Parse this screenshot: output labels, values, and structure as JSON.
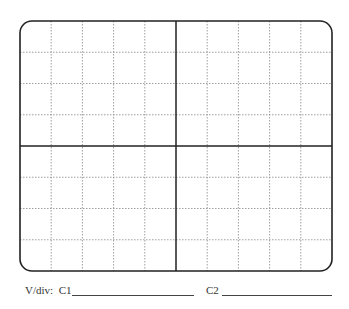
{
  "graticule": {
    "divisions_x": 10,
    "divisions_y": 8,
    "left": 20,
    "top": 21,
    "right": 332,
    "bottom": 271,
    "corner_radius": 12,
    "border_color": "#222222",
    "grid_color": "#888888"
  },
  "footer": {
    "vdiv_label": "V/div:",
    "c1_label": "C1",
    "c2_label": "C2"
  }
}
